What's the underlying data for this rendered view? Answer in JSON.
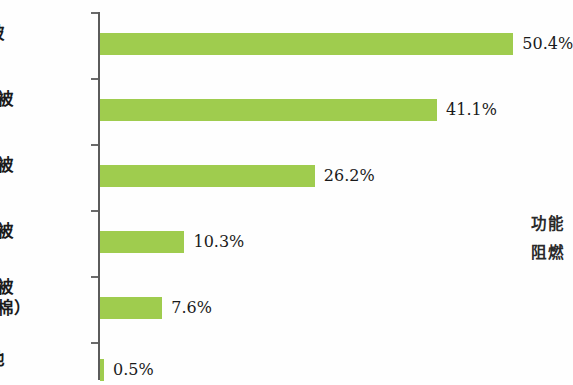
{
  "chart_data": {
    "type": "bar",
    "orientation": "horizontal",
    "title": "",
    "subtitle": "",
    "xlabel": "",
    "ylabel": "",
    "categories": [
      "棉被",
      "蚕丝被",
      "羽绒被",
      "羊毛被",
      "化纤被（中空棉）",
      "其他"
    ],
    "category_lines": [
      [
        "棉被"
      ],
      [
        "蚕丝被"
      ],
      [
        "羽绒被"
      ],
      [
        "羊毛被"
      ],
      [
        "化纤被",
        "（中空棉）"
      ],
      [
        "其他"
      ]
    ],
    "values": [
      50.4,
      41.1,
      26.2,
      10.3,
      7.6,
      0.5
    ],
    "value_labels": [
      "50.4%",
      "41.1%",
      "26.2%",
      "10.3%",
      "7.6%",
      "0.5%"
    ],
    "xlim": [
      0,
      50.4
    ],
    "grid": false,
    "legend": false,
    "bar_color": "#9fcc4e",
    "axis_color": "#5b5b5b",
    "text_color": "#1b1b1b",
    "background_color": "#fefefe"
  },
  "annotation": {
    "lines": [
      "功能",
      "阻燃"
    ]
  }
}
